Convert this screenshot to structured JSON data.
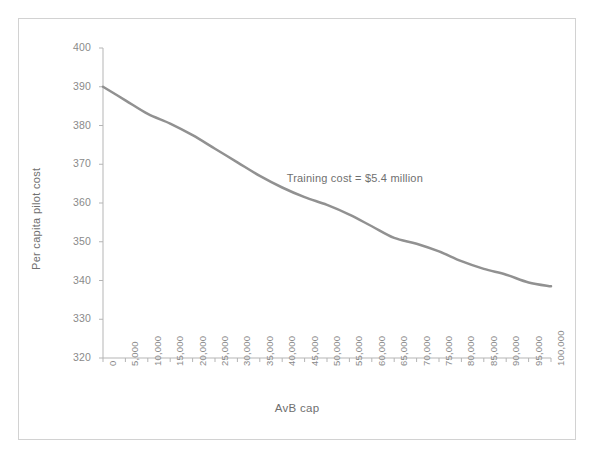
{
  "figure": {
    "background_color": "#ffffff",
    "frame_color": "#d2d2d2"
  },
  "chart_data": {
    "type": "line",
    "title": "",
    "subtitle": "",
    "xlabel": "AvB cap",
    "ylabel": "Per capita pilot cost",
    "xlim": [
      0,
      100000
    ],
    "ylim": [
      320,
      400
    ],
    "ytick_step": 10,
    "xtick_step": 5000,
    "grid": false,
    "legend": null,
    "legend_position": "none",
    "line_color": "#919191",
    "line_width": 2.5,
    "markers": false,
    "x": [
      0,
      5000,
      10000,
      15000,
      20000,
      25000,
      30000,
      35000,
      40000,
      45000,
      50000,
      55000,
      60000,
      65000,
      70000,
      75000,
      80000,
      85000,
      90000,
      95000,
      100000
    ],
    "categories": [
      "0",
      "5,000",
      "10,000",
      "15,000",
      "20,000",
      "25,000",
      "30,000",
      "35,000",
      "40,000",
      "45,000",
      "50,000",
      "55,000",
      "60,000",
      "65,000",
      "70,000",
      "75,000",
      "80,000",
      "85,000",
      "90,000",
      "95,000",
      "100,000"
    ],
    "values": [
      390.0,
      386.5,
      383.0,
      380.5,
      377.5,
      374.0,
      370.5,
      367.0,
      364.0,
      361.5,
      359.5,
      357.0,
      354.0,
      351.0,
      349.5,
      347.5,
      345.0,
      343.0,
      341.5,
      339.5,
      338.5
    ],
    "series": [
      {
        "name": "Per capita pilot cost",
        "values": [
          390.0,
          386.5,
          383.0,
          380.5,
          377.5,
          374.0,
          370.5,
          367.0,
          364.0,
          361.5,
          359.5,
          357.0,
          354.0,
          351.0,
          349.5,
          347.5,
          345.0,
          343.0,
          341.5,
          339.5,
          338.5
        ]
      }
    ],
    "ytick_labels": [
      "400",
      "390",
      "380",
      "370",
      "360",
      "350",
      "340",
      "330",
      "320"
    ],
    "ytick_values": [
      400,
      390,
      380,
      370,
      360,
      350,
      340,
      330,
      320
    ],
    "xtick_labels": [
      "0",
      "5,000",
      "10,000",
      "15,000",
      "20,000",
      "25,000",
      "30,000",
      "35,000",
      "40,000",
      "45,000",
      "50,000",
      "55,000",
      "60,000",
      "65,000",
      "70,000",
      "75,000",
      "80,000",
      "85,000",
      "90,000",
      "95,000",
      "100,000"
    ],
    "annotations": [
      {
        "text": "Training cost = $5.4 million",
        "x": 41000,
        "y": 366
      }
    ],
    "axis_color": "#b5b5b5",
    "tick_label_color": "#8a8a8a",
    "axis_label_color": "#6f6f6f"
  }
}
